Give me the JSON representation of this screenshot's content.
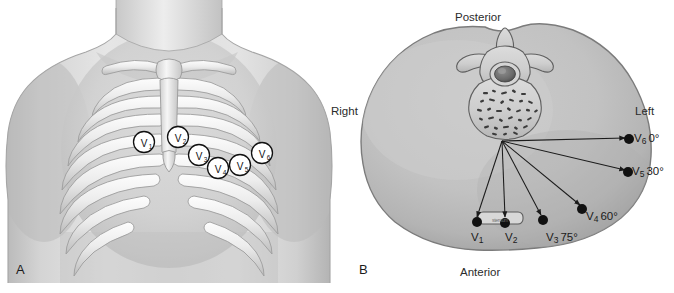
{
  "figure": {
    "panels": [
      {
        "letter": "A",
        "name": "anterior-chest-view",
        "electrodes": [
          {
            "id": "V1",
            "label": "V",
            "sub": "1"
          },
          {
            "id": "V2",
            "label": "V",
            "sub": "2"
          },
          {
            "id": "V3",
            "label": "V",
            "sub": "3"
          },
          {
            "id": "V4",
            "label": "V",
            "sub": "4"
          },
          {
            "id": "V5",
            "label": "V",
            "sub": "5"
          },
          {
            "id": "V6",
            "label": "V",
            "sub": "6"
          }
        ]
      },
      {
        "letter": "B",
        "name": "chest-cross-section-view",
        "orientation": {
          "posterior": "Posterior",
          "anterior": "Anterior",
          "right": "Right",
          "left": "Left"
        },
        "sternum_caption": "sternum",
        "electrodes": [
          {
            "id": "V1",
            "label": "V",
            "sub": "1",
            "angle": ""
          },
          {
            "id": "V2",
            "label": "V",
            "sub": "2",
            "angle": ""
          },
          {
            "id": "V3",
            "label": "V",
            "sub": "3",
            "angle": "75°"
          },
          {
            "id": "V4",
            "label": "V",
            "sub": "4",
            "angle": "60°"
          },
          {
            "id": "V5",
            "label": "V",
            "sub": "5",
            "angle": "30°"
          },
          {
            "id": "V6",
            "label": "V",
            "sub": "6",
            "angle": "0°"
          }
        ]
      }
    ]
  },
  "colors": {
    "background": "#ffffff",
    "skin_light": "#e2e2e2",
    "skin_mid": "#c3c3c3",
    "skin_dark": "#9d9d9d",
    "bone_light": "#f1f1f1",
    "bone_edge": "#9a9a9a",
    "outline": "#6d6d6d",
    "ink": "#1b1b1b",
    "dot": "#111111"
  }
}
